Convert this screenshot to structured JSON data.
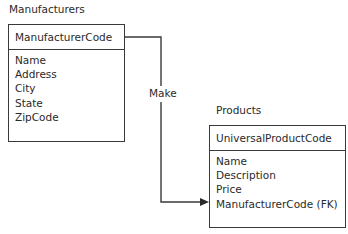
{
  "diagram": {
    "type": "entity-relationship",
    "entities": [
      {
        "title": "Manufacturers",
        "primary_key": "ManufacturerCode",
        "attributes": [
          "Name",
          "Address",
          "City",
          "State",
          "ZipCode"
        ]
      },
      {
        "title": "Products",
        "primary_key": "UniversalProductCode",
        "attributes": [
          "Name",
          "Description",
          "Price",
          "ManufacturerCode (FK)"
        ]
      }
    ],
    "relationships": [
      {
        "label": "Make",
        "from": "Manufacturers",
        "to": "Products"
      }
    ]
  },
  "colors": {
    "line": "#3a3a3a",
    "text": "#2a2a2a",
    "background": "#ffffff"
  }
}
